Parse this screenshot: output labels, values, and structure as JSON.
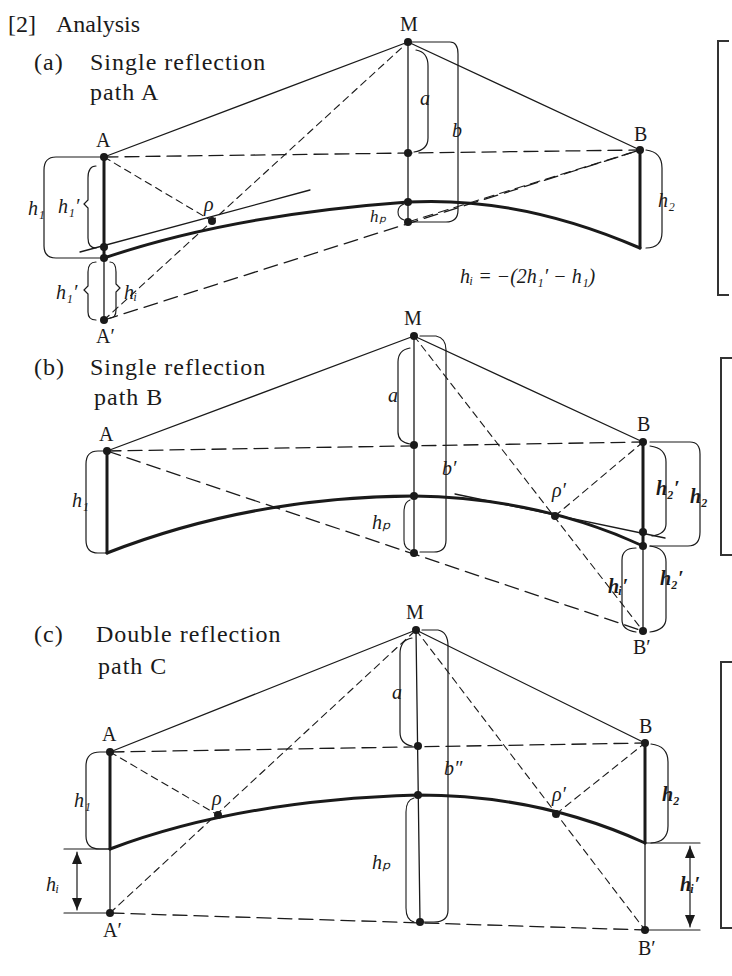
{
  "header": {
    "section": "[2]",
    "title": "Analysis"
  },
  "panels": [
    {
      "id": "a",
      "tag": "(a)",
      "title_line1": "Single reflection",
      "title_line2": "path A",
      "points": {
        "A": "A",
        "A_prime": "A′",
        "M": "M",
        "B": "B",
        "rho": "ρ"
      },
      "dims": {
        "h1": "h₁",
        "h1_prime_top": "h₁′",
        "h1_prime_bottom": "h₁′",
        "hi": "hᵢ",
        "a": "a",
        "b": "b",
        "hp": "hₚ",
        "h2": "h₂"
      },
      "equation": "hᵢ = −(2h₁′ − h₁)"
    },
    {
      "id": "b",
      "tag": "(b)",
      "title_line1": "Single reflection",
      "title_line2": "path B",
      "points": {
        "A": "A",
        "M": "M",
        "B": "B",
        "B_prime": "B′",
        "rho_prime": "ρ′"
      },
      "dims": {
        "h1": "h₁",
        "a": "a",
        "b_prime": "b′",
        "hp": "hₚ",
        "h2": "h₂",
        "h2_prime_top": "h₂′",
        "h2_prime_bottom": "h₂′",
        "hi_prime": "hᵢ′"
      }
    },
    {
      "id": "c",
      "tag": "(c)",
      "title_line1": "Double reflection",
      "title_line2": "path C",
      "points": {
        "A": "A",
        "A_prime": "A′",
        "M": "M",
        "B": "B",
        "B_prime": "B′",
        "rho": "ρ",
        "rho_prime": "ρ′"
      },
      "dims": {
        "h1": "h₁",
        "hi": "hᵢ",
        "a": "a",
        "b_double_prime": "b″",
        "hp": "hₚ",
        "h2": "h₂",
        "hi_prime": "hᵢ′"
      }
    }
  ]
}
